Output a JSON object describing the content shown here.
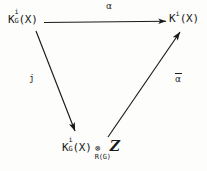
{
  "diagram": {
    "type": "commutative-triangle",
    "background_color": "#fdfdfb",
    "ink_color": "#1a1a1a",
    "nodes": [
      {
        "id": "topleft",
        "position": "top-left",
        "base": "K",
        "superscript": "i",
        "subscript": "G",
        "argument": "(X)",
        "full_text": "K_G^i(X)"
      },
      {
        "id": "topright",
        "position": "top-right",
        "base": "K",
        "superscript": "i",
        "subscript": "",
        "argument": "(X)",
        "full_text": "K^i(X)"
      },
      {
        "id": "bottom",
        "position": "bottom-center",
        "base": "K",
        "superscript": "i",
        "subscript": "G",
        "argument": "(X)",
        "tensor_symbol": "⊗",
        "tensor_subscript": "R(G)",
        "tensor_operand": "Z",
        "full_text": "K_G^i(X) ⊗_{R(G)} Z"
      }
    ],
    "arrows": [
      {
        "id": "alpha",
        "from": "topleft",
        "to": "topright",
        "label": "α",
        "label_overbar": false,
        "direction": "horizontal-right"
      },
      {
        "id": "j",
        "from": "topleft",
        "to": "bottom",
        "label": "j",
        "label_overbar": false,
        "direction": "diagonal-down-right"
      },
      {
        "id": "alpha-bar",
        "from": "bottom",
        "to": "topright",
        "label": "α",
        "label_overbar": true,
        "direction": "diagonal-up-right"
      }
    ]
  }
}
